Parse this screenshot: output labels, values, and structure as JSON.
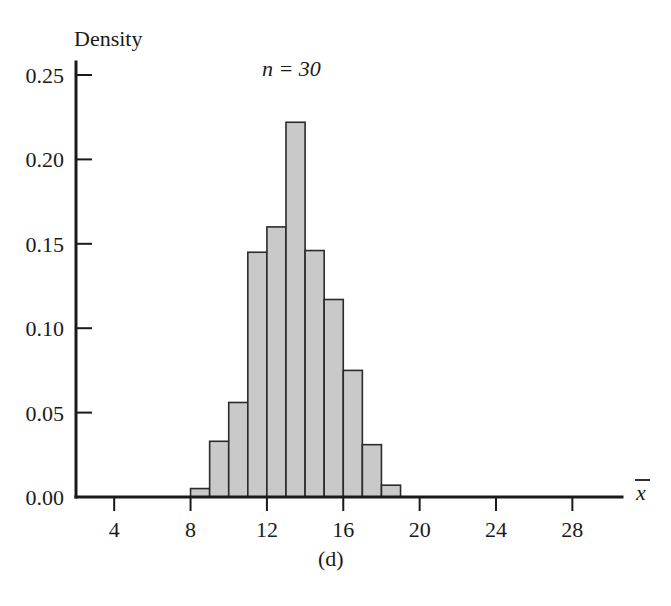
{
  "figure": {
    "caption": "(d)",
    "annotation": "n = 30",
    "y_axis_title": "Density",
    "x_axis_title": "x̄"
  },
  "chart_data": {
    "type": "bar",
    "title": "",
    "subtitle": "",
    "annotation": "n = 30",
    "caption": "(d)",
    "xlabel": "x̄",
    "ylabel": "Density",
    "xlim": [
      2,
      30
    ],
    "ylim": [
      0.0,
      0.26
    ],
    "grid": false,
    "legend": null,
    "x_ticks": [
      4,
      8,
      12,
      16,
      20,
      24,
      28
    ],
    "x_tick_labels": [
      "4",
      "8",
      "12",
      "16",
      "20",
      "24",
      "28"
    ],
    "y_ticks": [
      0.0,
      0.05,
      0.1,
      0.15,
      0.2,
      0.25
    ],
    "y_tick_labels": [
      "0.00",
      "0.05",
      "0.10",
      "0.15",
      "0.20",
      "0.25"
    ],
    "bin_width": 1,
    "bin_edges": [
      8,
      9,
      10,
      11,
      12,
      13,
      14,
      15,
      16,
      17,
      18,
      19
    ],
    "categories": [
      "8-9",
      "9-10",
      "10-11",
      "11-12",
      "12-13",
      "13-14",
      "14-15",
      "15-16",
      "16-17",
      "17-18",
      "18-19"
    ],
    "values": [
      0.005,
      0.033,
      0.056,
      0.145,
      0.16,
      0.222,
      0.146,
      0.117,
      0.075,
      0.031,
      0.007
    ],
    "bar_color": "#c9c9c9",
    "bar_edge_color": "#2b2b2b"
  }
}
